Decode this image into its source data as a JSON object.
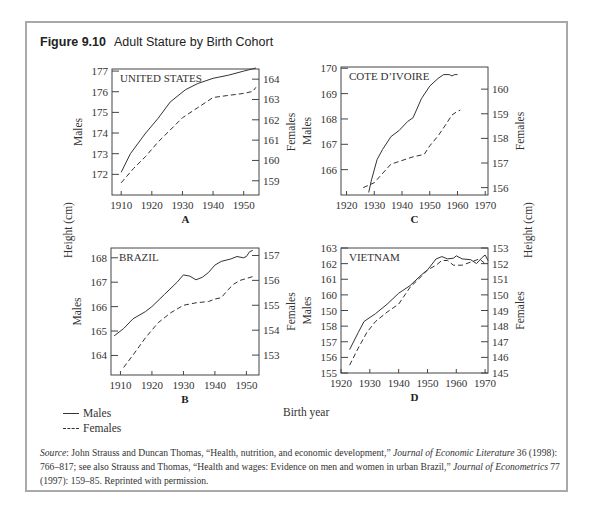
{
  "figure": {
    "number": "Figure 9.10",
    "title": "Adult Stature by Birth Cohort",
    "shared_ylabel": "Height (cm)",
    "shared_xlabel": "Birth year",
    "legend": [
      {
        "label": "Males",
        "style": "solid"
      },
      {
        "label": "Females",
        "style": "dashed"
      }
    ],
    "source": {
      "prefix": "Source",
      "text1": ": John Strauss and Duncan Thomas, “Health, nutrition, and economic development,” ",
      "journal1": "Journal of Economic Literature",
      "text2": " 36 (1998): 766–817; see also Strauss and Thomas, “Health and wages: Evidence on men and women in urban Brazil,” ",
      "journal2": "Journal of Econometrics",
      "text3": " 77 (1997): 159–85. Reprinted with permission."
    }
  },
  "chart_data": [
    {
      "type": "line",
      "panel": "A",
      "title": "UNITED STATES",
      "xlabel": "",
      "ylabel": "Males",
      "y2label": "Females",
      "xticks": [
        1910,
        1920,
        1930,
        1940,
        1950
      ],
      "yticks": [
        172,
        173,
        174,
        175,
        176,
        177
      ],
      "y2ticks": [
        159,
        160,
        161,
        162,
        163,
        164
      ],
      "xlim": [
        1907,
        1955
      ],
      "ylim": [
        171,
        177.1
      ],
      "y2lim": [
        158.3,
        164.5
      ],
      "series": [
        {
          "name": "Males",
          "axis": "left",
          "x": [
            1910,
            1913,
            1917,
            1918,
            1922,
            1926,
            1931,
            1935,
            1940,
            1945,
            1950,
            1954
          ],
          "values": [
            172.1,
            173.0,
            173.8,
            174.0,
            174.7,
            175.5,
            176.1,
            176.4,
            176.65,
            176.8,
            177.0,
            177.15
          ]
        },
        {
          "name": "Females",
          "axis": "right",
          "x": [
            1910,
            1914,
            1918,
            1922,
            1926,
            1930,
            1935,
            1940,
            1945,
            1950,
            1953,
            1954
          ],
          "values": [
            158.9,
            159.6,
            160.2,
            160.9,
            161.5,
            162.1,
            162.6,
            163.1,
            163.2,
            163.3,
            163.4,
            163.6
          ]
        }
      ]
    },
    {
      "type": "line",
      "panel": "B",
      "title": "BRAZIL",
      "xlabel": "",
      "ylabel": "Males",
      "y2label": "Females",
      "xticks": [
        1910,
        1920,
        1930,
        1940,
        1950
      ],
      "yticks": [
        164,
        165,
        166,
        167,
        168
      ],
      "y2ticks": [
        153,
        154,
        155,
        156,
        157
      ],
      "xlim": [
        1907,
        1954
      ],
      "ylim": [
        163.2,
        168.4
      ],
      "y2lim": [
        152.2,
        157.3
      ],
      "series": [
        {
          "name": "Males",
          "axis": "left",
          "x": [
            1908,
            1911,
            1914,
            1918,
            1920,
            1924,
            1928,
            1930,
            1932,
            1934,
            1936,
            1938,
            1940,
            1942,
            1945,
            1947,
            1949,
            1950,
            1951,
            1952
          ],
          "values": [
            164.8,
            165.1,
            165.5,
            165.8,
            166.0,
            166.5,
            167.0,
            167.3,
            167.25,
            167.1,
            167.2,
            167.4,
            167.7,
            167.85,
            167.95,
            168.05,
            168.0,
            168.05,
            168.25,
            168.3
          ]
        },
        {
          "name": "Females",
          "axis": "right",
          "x": [
            1911,
            1914,
            1918,
            1922,
            1926,
            1930,
            1934,
            1938,
            1940,
            1942,
            1944,
            1946,
            1948,
            1952
          ],
          "values": [
            152.5,
            153.0,
            153.7,
            154.3,
            154.7,
            155.0,
            155.1,
            155.15,
            155.25,
            155.3,
            155.6,
            155.85,
            156.0,
            156.15
          ]
        }
      ]
    },
    {
      "type": "line",
      "panel": "C",
      "title": "COTE D’IVOIRE",
      "xlabel": "",
      "ylabel": "Males",
      "y2label": "Females",
      "xticks": [
        1920,
        1930,
        1940,
        1950,
        1960,
        1970
      ],
      "yticks": [
        166,
        167,
        168,
        169,
        170
      ],
      "y2ticks": [
        156,
        157,
        158,
        159,
        160
      ],
      "xlim": [
        1918,
        1971
      ],
      "ylim": [
        165.0,
        170.05
      ],
      "y2lim": [
        155.7,
        160.9
      ],
      "series": [
        {
          "name": "Males",
          "axis": "left",
          "x": [
            1928,
            1929,
            1931,
            1933,
            1936,
            1939,
            1942,
            1944,
            1947,
            1950,
            1953,
            1955,
            1957,
            1958,
            1959,
            1960
          ],
          "values": [
            165.1,
            165.6,
            166.4,
            166.8,
            167.3,
            167.55,
            167.9,
            168.05,
            168.8,
            169.3,
            169.6,
            169.75,
            169.75,
            169.7,
            169.75,
            169.75
          ]
        },
        {
          "name": "Females",
          "axis": "right",
          "x": [
            1926,
            1928,
            1930,
            1932,
            1936,
            1940,
            1944,
            1948,
            1950,
            1953,
            1956,
            1958,
            1960,
            1961
          ],
          "values": [
            156.0,
            156.1,
            156.2,
            156.45,
            156.95,
            157.1,
            157.25,
            157.35,
            157.7,
            158.1,
            158.6,
            158.95,
            159.1,
            159.15
          ]
        }
      ]
    },
    {
      "type": "line",
      "panel": "D",
      "title": "VIETNAM",
      "xlabel": "",
      "ylabel": "Males",
      "y2label": "Females",
      "xticks": [
        1920,
        1930,
        1940,
        1950,
        1960,
        1970
      ],
      "yticks": [
        155,
        156,
        157,
        158,
        "150",
        160,
        161,
        162,
        163
      ],
      "y2ticks": [
        145,
        146,
        147,
        148,
        149,
        150,
        151,
        152,
        153
      ],
      "xlim": [
        1920,
        1971
      ],
      "ylim": [
        155,
        163
      ],
      "y2lim": [
        145,
        153
      ],
      "series": [
        {
          "name": "Males",
          "axis": "left",
          "x": [
            1923,
            1926,
            1928,
            1932,
            1936,
            1940,
            1944,
            1948,
            1950,
            1953,
            1955,
            1957,
            1959,
            1960,
            1962,
            1965,
            1967,
            1969,
            1970,
            1971
          ],
          "values": [
            156.5,
            157.6,
            158.3,
            158.8,
            159.4,
            160.1,
            160.6,
            161.3,
            161.6,
            162.3,
            162.45,
            162.3,
            162.35,
            162.5,
            162.3,
            162.25,
            162.0,
            162.4,
            162.55,
            162.2
          ]
        },
        {
          "name": "Females",
          "axis": "right",
          "x": [
            1923,
            1926,
            1929,
            1932,
            1936,
            1940,
            1944,
            1948,
            1950,
            1953,
            1955,
            1957,
            1959,
            1962,
            1965,
            1968,
            1970,
            1971
          ],
          "values": [
            145.5,
            146.6,
            147.6,
            148.3,
            148.9,
            149.4,
            150.5,
            151.2,
            151.6,
            151.9,
            152.2,
            152.2,
            151.9,
            151.9,
            152.1,
            152.3,
            152.0,
            152.0
          ]
        }
      ]
    }
  ]
}
